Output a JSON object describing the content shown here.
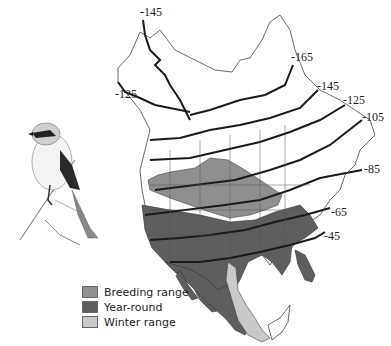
{
  "map": {
    "subject": "Loggerhead Shrike range map, North America",
    "colors": {
      "breeding": "#8f8f8f",
      "year_round": "#5e5e5e",
      "winter": "#c9c9c9",
      "contour_line": "#1a1a1a",
      "border_line": "#555555"
    },
    "contour_labels": [
      {
        "text": "-145",
        "x": 140,
        "y": 12
      },
      {
        "text": "-125",
        "x": 115,
        "y": 94
      },
      {
        "text": "-165",
        "x": 291,
        "y": 57
      },
      {
        "text": "-145",
        "x": 317,
        "y": 86
      },
      {
        "text": "-125",
        "x": 343,
        "y": 100
      },
      {
        "text": "-105",
        "x": 362,
        "y": 117
      },
      {
        "text": "-85",
        "x": 364,
        "y": 169
      },
      {
        "text": "-65",
        "x": 331,
        "y": 212
      },
      {
        "text": "-45",
        "x": 324,
        "y": 236
      }
    ]
  },
  "illustration": {
    "icon": "shrike-bird-illustration"
  },
  "legend": {
    "items": [
      {
        "label": "Breeding range",
        "color": "#8f8f8f"
      },
      {
        "label": "Year-round",
        "color": "#5e5e5e"
      },
      {
        "label": "Winter range",
        "color": "#c9c9c9"
      }
    ]
  }
}
